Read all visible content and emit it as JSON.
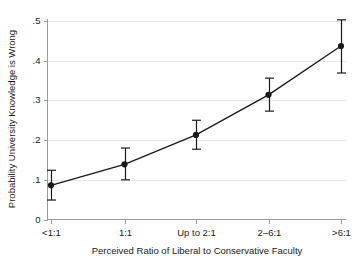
{
  "chart_data": {
    "type": "line",
    "title": "",
    "subtitle": "",
    "xlabel": "Perceived Ratio of Liberal to Conservative Faculty",
    "ylabel": "Probability University Knowledge is Wrong",
    "categories": [
      "<1:1",
      "1:1",
      "Up to 2:1",
      "2–6:1",
      ">6:1"
    ],
    "values": [
      0.086,
      0.139,
      0.213,
      0.314,
      0.437
    ],
    "error_low": [
      0.049,
      0.1,
      0.177,
      0.273,
      0.369
    ],
    "error_high": [
      0.124,
      0.18,
      0.25,
      0.356,
      0.503
    ],
    "ylim": [
      0,
      0.5
    ],
    "ytick_labels": [
      "0",
      ".1",
      ".2",
      ".3",
      ".4",
      ".5"
    ],
    "ytick_values": [
      0,
      0.1,
      0.2,
      0.3,
      0.4,
      0.5
    ],
    "grid": true,
    "grid_axis": "y",
    "legend": false,
    "legend_position": "none",
    "marker": "filled-circle",
    "error_bar_style": "capped-vertical",
    "colors": {
      "line": "#1a1a1a",
      "marker": "#1a1a1a",
      "errorbar": "#1a1a1a",
      "gridline": "#eaeaea",
      "axis": "#9a9a9a",
      "background": "#ffffff",
      "text": "#1a1a1a"
    }
  },
  "axes": {
    "y_title": "Probability University Knowledge is Wrong",
    "x_title": "Perceived Ratio of Liberal to Conservative Faculty"
  },
  "ticks": {
    "y": [
      {
        "label": ".5",
        "value": 0.5
      },
      {
        "label": ".4",
        "value": 0.4
      },
      {
        "label": ".3",
        "value": 0.3
      },
      {
        "label": ".2",
        "value": 0.2
      },
      {
        "label": ".1",
        "value": 0.1
      },
      {
        "label": "0",
        "value": 0
      }
    ],
    "x": [
      {
        "label": "<1:1"
      },
      {
        "label": "1:1"
      },
      {
        "label": "Up to 2:1"
      },
      {
        "label": "2–6:1"
      },
      {
        "label": ">6:1"
      }
    ]
  }
}
